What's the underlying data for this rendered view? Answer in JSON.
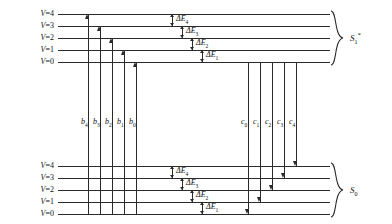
{
  "diagram": {
    "type": "energy-level-diagram",
    "line_color": "#2a2a2a",
    "background": "#ffffff"
  },
  "states": [
    {
      "id": "excited",
      "label": "S",
      "subscript": "1",
      "superscript": "*",
      "position": "top"
    },
    {
      "id": "ground",
      "label": "S",
      "subscript": "0",
      "superscript": "",
      "position": "bottom"
    }
  ],
  "upper_state": {
    "levels": [
      {
        "label": "V",
        "eq": "=",
        "value": "4",
        "y": 14
      },
      {
        "label": "V",
        "eq": "=",
        "value": "3",
        "y": 26
      },
      {
        "label": "V",
        "eq": "=",
        "value": "2",
        "y": 38
      },
      {
        "label": "V",
        "eq": "=",
        "value": "1",
        "y": 50
      },
      {
        "label": "V",
        "eq": "=",
        "value": "0",
        "y": 62
      }
    ],
    "delta_labels": [
      {
        "text": "ΔE",
        "sub": "4",
        "x": 178,
        "y": 14,
        "h": 12
      },
      {
        "text": "ΔE",
        "sub": "3",
        "x": 188,
        "y": 26,
        "h": 12
      },
      {
        "text": "ΔE",
        "sub": "2",
        "x": 198,
        "y": 38,
        "h": 12
      },
      {
        "text": "ΔE",
        "sub": "1",
        "x": 208,
        "y": 50,
        "h": 12
      }
    ]
  },
  "lower_state": {
    "levels": [
      {
        "label": "V",
        "eq": "=",
        "value": "4",
        "y": 166
      },
      {
        "label": "V",
        "eq": "=",
        "value": "3",
        "y": 178
      },
      {
        "label": "V",
        "eq": "=",
        "value": "2",
        "y": 190
      },
      {
        "label": "V",
        "eq": "=",
        "value": "1",
        "y": 202
      },
      {
        "label": "V",
        "eq": "=",
        "value": "0",
        "y": 214
      }
    ],
    "delta_labels": [
      {
        "text": "ΔE",
        "sub": "4",
        "x": 178,
        "y": 166,
        "h": 12
      },
      {
        "text": "ΔE",
        "sub": "3",
        "x": 188,
        "y": 178,
        "h": 12
      },
      {
        "text": "ΔE",
        "sub": "2",
        "x": 198,
        "y": 190,
        "h": 12
      },
      {
        "text": "ΔE",
        "sub": "1",
        "x": 208,
        "y": 202,
        "h": 12
      }
    ]
  },
  "absorption_arrows": {
    "direction": "up",
    "from_level": "S0 V=0",
    "transitions": [
      {
        "label": "b",
        "sub": "4",
        "x": 88,
        "top": 14,
        "bottom": 214
      },
      {
        "label": "b",
        "sub": "3",
        "x": 100,
        "top": 26,
        "bottom": 214
      },
      {
        "label": "b",
        "sub": "2",
        "x": 112,
        "top": 38,
        "bottom": 214
      },
      {
        "label": "b",
        "sub": "1",
        "x": 124,
        "top": 50,
        "bottom": 214
      },
      {
        "label": "b",
        "sub": "0",
        "x": 136,
        "top": 62,
        "bottom": 214
      }
    ],
    "label_y": 122
  },
  "emission_arrows": {
    "direction": "down",
    "from_level": "S1 V=0",
    "transitions": [
      {
        "label": "c",
        "sub": "0",
        "x": 248,
        "top": 62,
        "bottom": 214
      },
      {
        "label": "c",
        "sub": "1",
        "x": 260,
        "top": 62,
        "bottom": 202
      },
      {
        "label": "c",
        "sub": "2",
        "x": 272,
        "top": 62,
        "bottom": 190
      },
      {
        "label": "c",
        "sub": "3",
        "x": 284,
        "top": 62,
        "bottom": 178
      },
      {
        "label": "c",
        "sub": "4",
        "x": 296,
        "top": 62,
        "bottom": 166
      }
    ],
    "label_y": 122
  },
  "geometry": {
    "line_left": 58,
    "line_right": 330,
    "label_right": 54
  }
}
